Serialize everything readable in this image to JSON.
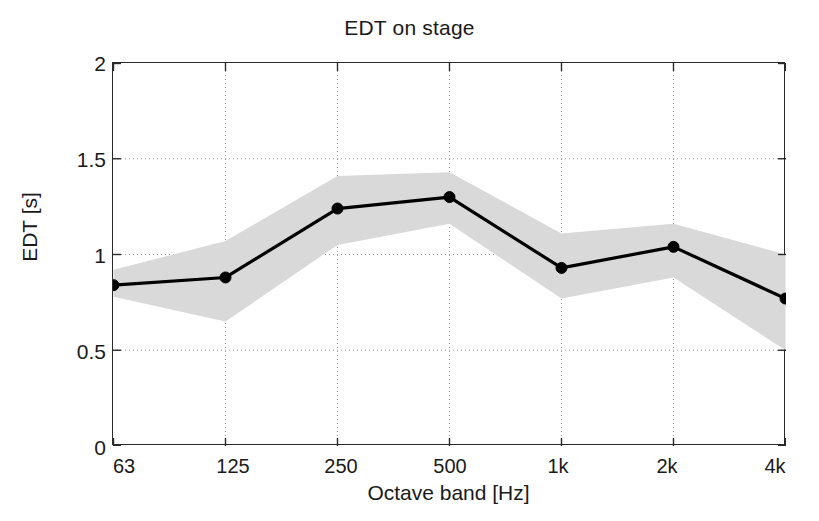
{
  "chart_data": {
    "type": "line",
    "title": "EDT on stage",
    "xlabel": "Octave band [Hz]",
    "ylabel": "EDT [s]",
    "categories": [
      "63",
      "125",
      "250",
      "500",
      "1k",
      "2k",
      "4k"
    ],
    "x_tick_labels": [
      "63",
      "125",
      "250",
      "500",
      "1k",
      "2k",
      "4k"
    ],
    "y_tick_labels": [
      "0",
      "0.5",
      "1",
      "1.5",
      "2"
    ],
    "y_ticks": [
      0,
      0.5,
      1,
      1.5,
      2
    ],
    "ylim": [
      0,
      2
    ],
    "grid": true,
    "grid_style": "dotted",
    "legend": "none",
    "series": [
      {
        "name": "EDT mean",
        "marker": "filled-circle",
        "line_color": "#000000",
        "values": [
          0.84,
          0.88,
          1.24,
          1.3,
          0.93,
          1.04,
          0.77
        ]
      }
    ],
    "band": {
      "name": "standard deviation band",
      "fill_color": "#d9d9d9",
      "upper": [
        0.92,
        1.07,
        1.41,
        1.43,
        1.11,
        1.16,
        1.0
      ],
      "lower": [
        0.78,
        0.65,
        1.05,
        1.16,
        0.77,
        0.88,
        0.5
      ]
    },
    "annotations": []
  },
  "figure": {
    "background": "#ffffff",
    "axis_color": "#2a2a2a",
    "grid_color": "#9a9a9a",
    "marker_size_px": 11
  }
}
